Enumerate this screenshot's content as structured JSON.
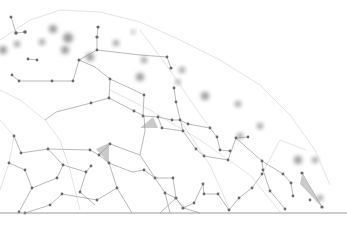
{
  "scene": {
    "description": "Abstract plexus network of gray nodes connected by thin lines on white background",
    "colors": {
      "background": "#ffffff",
      "node": "#6a6a6a",
      "edge": "#8a8a8a",
      "baseline": "#9a9a9a"
    },
    "nodes": [
      [
        11,
        17
      ],
      [
        16,
        33
      ],
      [
        25,
        32
      ],
      [
        54,
        30
      ],
      [
        67,
        29
      ],
      [
        98,
        27
      ],
      [
        97,
        37
      ],
      [
        97,
        50
      ],
      [
        79,
        60
      ],
      [
        37,
        60
      ],
      [
        28,
        59
      ],
      [
        12,
        75
      ],
      [
        19,
        81
      ],
      [
        52,
        81
      ],
      [
        73,
        81
      ],
      [
        110,
        79
      ],
      [
        109,
        98
      ],
      [
        91,
        103
      ],
      [
        144,
        69
      ],
      [
        145,
        84
      ],
      [
        134,
        111
      ],
      [
        140,
        114
      ],
      [
        167,
        57
      ],
      [
        171,
        68
      ],
      [
        144,
        95
      ],
      [
        143,
        116
      ],
      [
        158,
        117
      ],
      [
        172,
        120
      ],
      [
        174,
        88
      ],
      [
        176,
        102
      ],
      [
        183,
        131
      ],
      [
        162,
        128
      ],
      [
        210,
        128
      ],
      [
        217,
        137
      ],
      [
        220,
        150
      ],
      [
        236,
        138
      ],
      [
        248,
        137
      ],
      [
        230,
        151
      ],
      [
        196,
        149
      ],
      [
        204,
        156
      ],
      [
        228,
        160
      ],
      [
        262,
        161
      ],
      [
        263,
        170
      ],
      [
        270,
        191
      ],
      [
        285,
        209
      ],
      [
        293,
        196
      ],
      [
        291,
        183
      ],
      [
        283,
        174
      ],
      [
        308,
        183
      ],
      [
        276,
        180
      ],
      [
        322,
        148
      ],
      [
        307,
        145
      ],
      [
        313,
        111
      ],
      [
        306,
        150
      ],
      [
        302,
        173
      ],
      [
        14,
        136
      ],
      [
        21,
        153
      ],
      [
        48,
        149
      ],
      [
        9,
        163
      ],
      [
        25,
        170
      ],
      [
        32,
        188
      ],
      [
        62,
        194
      ],
      [
        57,
        178
      ],
      [
        63,
        165
      ],
      [
        91,
        166
      ],
      [
        99,
        155
      ],
      [
        110,
        144
      ],
      [
        86,
        172
      ],
      [
        97,
        200
      ],
      [
        117,
        188
      ],
      [
        132,
        213
      ],
      [
        90,
        150
      ],
      [
        109,
        163
      ],
      [
        144,
        170
      ],
      [
        155,
        178
      ],
      [
        165,
        193
      ],
      [
        176,
        198
      ],
      [
        183,
        208
      ],
      [
        194,
        203
      ],
      [
        203,
        184
      ],
      [
        173,
        178
      ],
      [
        204,
        194
      ],
      [
        218,
        194
      ],
      [
        229,
        210
      ],
      [
        239,
        198
      ],
      [
        252,
        188
      ],
      [
        262,
        174
      ],
      [
        19,
        212
      ],
      [
        25,
        213
      ],
      [
        50,
        205
      ],
      [
        62,
        192
      ],
      [
        80,
        192
      ],
      [
        95,
        205
      ],
      [
        180,
        120
      ],
      [
        188,
        124
      ]
    ],
    "baseline": {
      "y": 213,
      "x1": 0,
      "x2": 347
    }
  }
}
